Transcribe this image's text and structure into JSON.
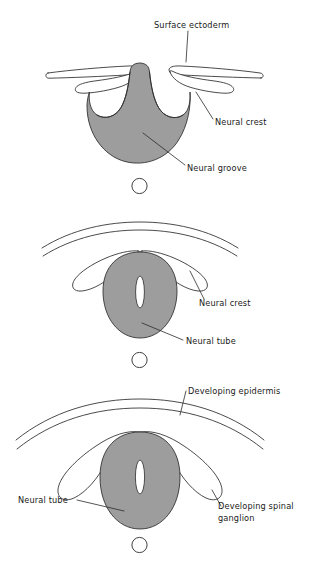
{
  "figure": {
    "background_color": "#ffffff",
    "neural_tissue_color": "#9d9d9d",
    "stroke_color": "#2b2b2b",
    "panel_count": 3
  },
  "panels": [
    {
      "id": "panel-1",
      "stage_name": "Neural groove stage",
      "labels": [
        {
          "key": "surface_ectoderm",
          "text": "Surface ectoderm"
        },
        {
          "key": "neural_crest",
          "text": "Neural crest"
        },
        {
          "key": "neural_groove",
          "text": "Neural groove"
        }
      ],
      "structures": [
        "surface-ectoderm-flap-left",
        "surface-ectoderm-flap-right",
        "neural-crest-lobe-left",
        "neural-crest-lobe-right",
        "neural-plate-folds",
        "notochord"
      ]
    },
    {
      "id": "panel-2",
      "stage_name": "Neural tube closure stage",
      "labels": [
        {
          "key": "neural_crest",
          "text": "Neural crest"
        },
        {
          "key": "neural_tube",
          "text": "Neural tube"
        }
      ],
      "structures": [
        "epidermis-arc-outer",
        "epidermis-arc-inner",
        "neural-crest-lobe-left",
        "neural-crest-lobe-right",
        "neural-tube",
        "neural-lumen",
        "notochord"
      ]
    },
    {
      "id": "panel-3",
      "stage_name": "Spinal ganglion formation stage",
      "labels": [
        {
          "key": "developing_epidermis",
          "text": "Developing epidermis"
        },
        {
          "key": "neural_tube",
          "text": "Neural tube"
        },
        {
          "key": "developing_spinal_ganglion_line1",
          "text": "Developing spinal"
        },
        {
          "key": "developing_spinal_ganglion_line2",
          "text": "ganglion"
        }
      ],
      "structures": [
        "epidermis-arc-outer",
        "epidermis-arc-inner",
        "spinal-ganglion-left",
        "spinal-ganglion-right",
        "neural-tube",
        "neural-lumen",
        "notochord"
      ]
    }
  ]
}
